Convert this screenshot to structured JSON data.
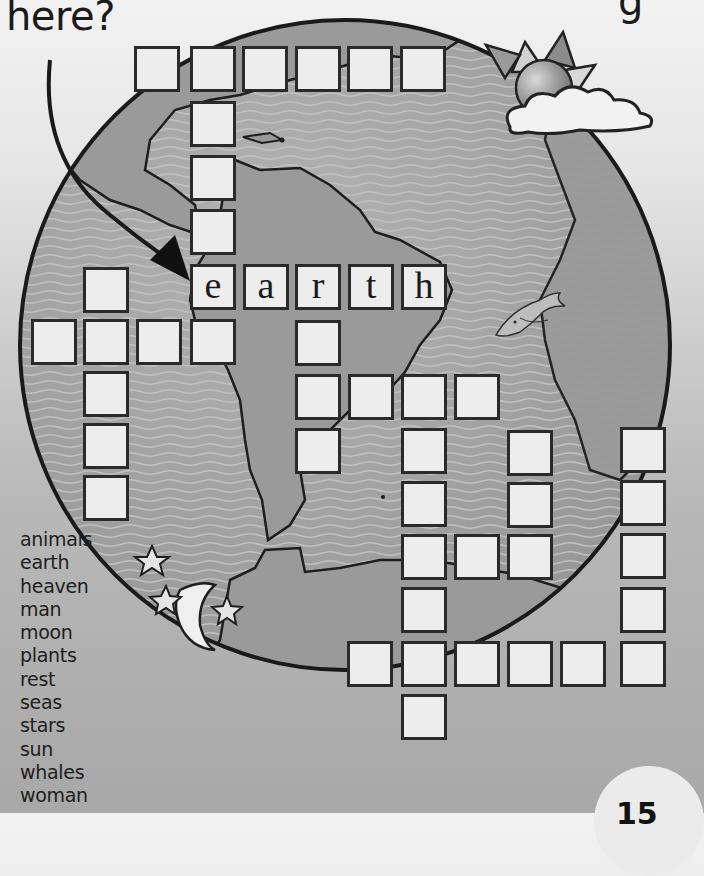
{
  "header": {
    "question_tail": "here?",
    "cut_off_glyph": "g"
  },
  "puzzle": {
    "type": "crossword",
    "given_word": "earth",
    "cells": [
      {
        "x": 134,
        "y": 46,
        "letter": ""
      },
      {
        "x": 190,
        "y": 46,
        "letter": ""
      },
      {
        "x": 242,
        "y": 46,
        "letter": ""
      },
      {
        "x": 295,
        "y": 46,
        "letter": ""
      },
      {
        "x": 347,
        "y": 46,
        "letter": ""
      },
      {
        "x": 400,
        "y": 46,
        "letter": ""
      },
      {
        "x": 190,
        "y": 101,
        "letter": ""
      },
      {
        "x": 190,
        "y": 155,
        "letter": ""
      },
      {
        "x": 190,
        "y": 209,
        "letter": ""
      },
      {
        "x": 190,
        "y": 264,
        "letter": "e"
      },
      {
        "x": 243,
        "y": 264,
        "letter": "a"
      },
      {
        "x": 295,
        "y": 264,
        "letter": "r"
      },
      {
        "x": 348,
        "y": 264,
        "letter": "t"
      },
      {
        "x": 401,
        "y": 264,
        "letter": "h"
      },
      {
        "x": 83,
        "y": 267,
        "letter": ""
      },
      {
        "x": 31,
        "y": 319,
        "letter": ""
      },
      {
        "x": 83,
        "y": 319,
        "letter": ""
      },
      {
        "x": 136,
        "y": 319,
        "letter": ""
      },
      {
        "x": 190,
        "y": 319,
        "letter": ""
      },
      {
        "x": 295,
        "y": 320,
        "letter": ""
      },
      {
        "x": 83,
        "y": 371,
        "letter": ""
      },
      {
        "x": 83,
        "y": 423,
        "letter": ""
      },
      {
        "x": 83,
        "y": 475,
        "letter": ""
      },
      {
        "x": 295,
        "y": 374,
        "letter": ""
      },
      {
        "x": 348,
        "y": 374,
        "letter": ""
      },
      {
        "x": 401,
        "y": 374,
        "letter": ""
      },
      {
        "x": 454,
        "y": 374,
        "letter": ""
      },
      {
        "x": 295,
        "y": 428,
        "letter": ""
      },
      {
        "x": 401,
        "y": 428,
        "letter": ""
      },
      {
        "x": 401,
        "y": 481,
        "letter": ""
      },
      {
        "x": 401,
        "y": 534,
        "letter": ""
      },
      {
        "x": 401,
        "y": 587,
        "letter": ""
      },
      {
        "x": 401,
        "y": 641,
        "letter": ""
      },
      {
        "x": 401,
        "y": 694,
        "letter": ""
      },
      {
        "x": 454,
        "y": 534,
        "letter": ""
      },
      {
        "x": 507,
        "y": 430,
        "letter": ""
      },
      {
        "x": 507,
        "y": 482,
        "letter": ""
      },
      {
        "x": 507,
        "y": 534,
        "letter": ""
      },
      {
        "x": 620,
        "y": 427,
        "letter": ""
      },
      {
        "x": 620,
        "y": 480,
        "letter": ""
      },
      {
        "x": 620,
        "y": 533,
        "letter": ""
      },
      {
        "x": 620,
        "y": 587,
        "letter": ""
      },
      {
        "x": 620,
        "y": 641,
        "letter": ""
      },
      {
        "x": 347,
        "y": 641,
        "letter": ""
      },
      {
        "x": 454,
        "y": 641,
        "letter": ""
      },
      {
        "x": 507,
        "y": 641,
        "letter": ""
      },
      {
        "x": 560,
        "y": 641,
        "letter": ""
      }
    ]
  },
  "word_bank": [
    "animals",
    "earth",
    "heaven",
    "man",
    "moon",
    "plants",
    "rest",
    "seas",
    "stars",
    "sun",
    "whales",
    "woman"
  ],
  "page_number": "15",
  "colors": {
    "globe_ocean": "#a9a9a9",
    "globe_land": "#9a9a9a",
    "cell_fill": "#ededed",
    "outline": "#2a2a2a"
  },
  "illustrations": [
    "globe-icon",
    "sun-icon",
    "cloud-icon",
    "dolphin-icon",
    "moon-icon",
    "star-icon",
    "arrow-icon"
  ]
}
